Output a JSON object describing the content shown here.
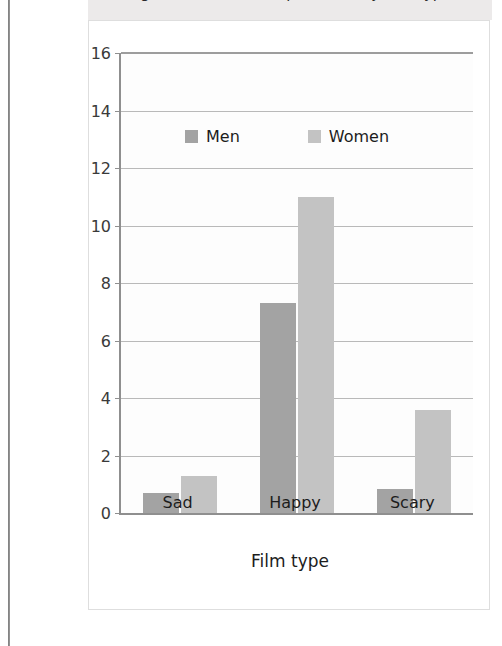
{
  "page": {
    "caption": "Figure: Number of expressions by film type"
  },
  "chart_data": {
    "type": "bar",
    "title": "",
    "categories": [
      "Sad",
      "Happy",
      "Scary"
    ],
    "series": [
      {
        "name": "Men",
        "color": "#a3a3a3",
        "values": [
          0.7,
          7.3,
          0.85
        ]
      },
      {
        "name": "Women",
        "color": "#c3c3c3",
        "values": [
          1.3,
          11.0,
          3.6
        ]
      }
    ],
    "xlabel": "Film type",
    "ylabel": "Number of expressions",
    "ylim": [
      0,
      16
    ],
    "ytick_labels": [
      "0",
      "2",
      "4",
      "6",
      "8",
      "10",
      "12",
      "14",
      "16"
    ],
    "ytick_values": [
      0,
      2,
      4,
      6,
      8,
      10,
      12,
      14,
      16
    ],
    "grid": true,
    "legend_position": "inside-top-center"
  }
}
